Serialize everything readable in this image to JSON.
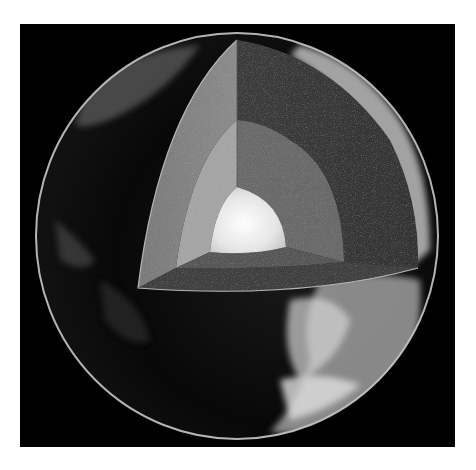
{
  "image": {
    "title": "Earth cutaway showing internal layers",
    "background_color": "#000000",
    "page_color": "#ffffff",
    "layers": [
      {
        "name": "crust",
        "label": "Crust",
        "color": "#8a8a8a"
      },
      {
        "name": "mantle",
        "label": "Mantle",
        "color": "#4a4a4a"
      },
      {
        "name": "outer_core",
        "label": "Outer Core",
        "color": "#9a9a9a"
      },
      {
        "name": "inner_core",
        "label": "Inner Core",
        "color": "#e8e8e8"
      }
    ],
    "colors": {
      "globe_rim": "#c8c8c8",
      "clouds": "#d0d0d0",
      "ocean": "#050505"
    }
  }
}
